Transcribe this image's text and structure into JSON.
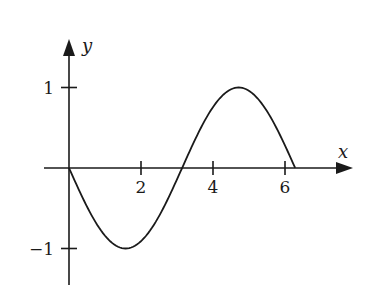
{
  "chart_data": {
    "type": "line",
    "title": "",
    "xlabel": "x",
    "ylabel": "y",
    "function": "y = -sin(x)",
    "x_range": [
      0,
      6.283
    ],
    "xlim": [
      -0.7,
      7.9
    ],
    "ylim": [
      -1.45,
      1.05
    ],
    "x_ticks": [
      2,
      4,
      6
    ],
    "x_tick_labels": [
      "2",
      "4",
      "6"
    ],
    "y_ticks": [
      1,
      -1
    ],
    "y_tick_labels": [
      "1",
      "−1"
    ],
    "grid": false,
    "legend": null,
    "series": [
      {
        "name": "curve",
        "x": [
          0,
          0.5,
          1.0,
          1.571,
          2.0,
          2.5,
          3.0,
          3.142,
          3.5,
          4.0,
          4.712,
          5.0,
          5.5,
          6.0,
          6.283
        ],
        "values": [
          0,
          -0.479,
          -0.841,
          -1.0,
          -0.909,
          -0.598,
          -0.141,
          0,
          0.351,
          0.757,
          1.0,
          0.959,
          0.706,
          0.279,
          0
        ]
      }
    ],
    "annotations": []
  },
  "colors": {
    "ink": "#1a1a1a",
    "background": "#ffffff"
  }
}
